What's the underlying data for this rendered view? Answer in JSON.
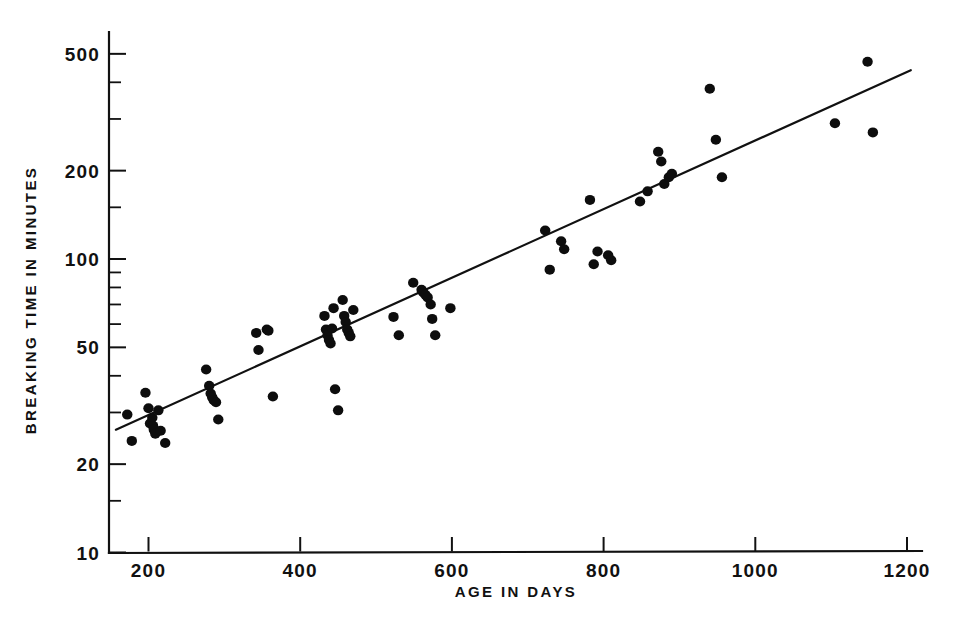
{
  "chart_data": {
    "type": "scatter",
    "title": "",
    "xlabel": "AGE  IN  DAYS",
    "ylabel": "BREAKING  TIME  IN  MINUTES",
    "xscale": "linear",
    "yscale": "log",
    "xlim": [
      150,
      1215
    ],
    "ylim": [
      10,
      560
    ],
    "grid": false,
    "legend": null,
    "xticks": [
      200,
      400,
      600,
      800,
      1000,
      1200
    ],
    "xtick_labels": [
      "200",
      "400",
      "600",
      "800",
      "1000",
      "1200"
    ],
    "yticks": [
      10,
      20,
      50,
      100,
      200,
      500
    ],
    "ytick_labels": [
      "10",
      "20",
      "50",
      "100",
      "200",
      "500"
    ],
    "yminor_ticks": [
      15,
      30,
      40,
      60,
      70,
      80,
      90,
      150,
      300,
      400
    ],
    "point_color": "#0d0d0d",
    "line_color": "#111111",
    "trend_line": {
      "x": [
        157,
        1205
      ],
      "y": [
        26.2,
        440
      ],
      "description": "fitted straight line on log-y axis"
    },
    "points": [
      {
        "x": 172,
        "y": 29.5
      },
      {
        "x": 178,
        "y": 24.0
      },
      {
        "x": 196,
        "y": 35.0
      },
      {
        "x": 200,
        "y": 31.0
      },
      {
        "x": 202,
        "y": 27.5
      },
      {
        "x": 205,
        "y": 28.8
      },
      {
        "x": 206,
        "y": 27.0
      },
      {
        "x": 207,
        "y": 26.2
      },
      {
        "x": 209,
        "y": 25.4
      },
      {
        "x": 213,
        "y": 30.5
      },
      {
        "x": 216,
        "y": 26.0
      },
      {
        "x": 222,
        "y": 23.6
      },
      {
        "x": 276,
        "y": 42.0
      },
      {
        "x": 280,
        "y": 37.0
      },
      {
        "x": 282,
        "y": 34.8
      },
      {
        "x": 284,
        "y": 33.8
      },
      {
        "x": 286,
        "y": 33.0
      },
      {
        "x": 289,
        "y": 32.5
      },
      {
        "x": 292,
        "y": 28.4
      },
      {
        "x": 342,
        "y": 56.0
      },
      {
        "x": 345,
        "y": 49.0
      },
      {
        "x": 356,
        "y": 57.5
      },
      {
        "x": 358,
        "y": 57.0
      },
      {
        "x": 364,
        "y": 34.0
      },
      {
        "x": 432,
        "y": 64.0
      },
      {
        "x": 434,
        "y": 57.5
      },
      {
        "x": 436,
        "y": 55.0
      },
      {
        "x": 438,
        "y": 53.0
      },
      {
        "x": 440,
        "y": 51.5
      },
      {
        "x": 442,
        "y": 58.0
      },
      {
        "x": 444,
        "y": 68.0
      },
      {
        "x": 446,
        "y": 36.0
      },
      {
        "x": 450,
        "y": 30.5
      },
      {
        "x": 456,
        "y": 72.5
      },
      {
        "x": 458,
        "y": 64.0
      },
      {
        "x": 460,
        "y": 61.0
      },
      {
        "x": 462,
        "y": 57.5
      },
      {
        "x": 464,
        "y": 56.0
      },
      {
        "x": 466,
        "y": 54.5
      },
      {
        "x": 470,
        "y": 67.0
      },
      {
        "x": 523,
        "y": 63.5
      },
      {
        "x": 530,
        "y": 55.0
      },
      {
        "x": 549,
        "y": 83.0
      },
      {
        "x": 560,
        "y": 78.5
      },
      {
        "x": 562,
        "y": 77.0
      },
      {
        "x": 565,
        "y": 75.5
      },
      {
        "x": 568,
        "y": 74.0
      },
      {
        "x": 572,
        "y": 70.0
      },
      {
        "x": 574,
        "y": 62.5
      },
      {
        "x": 578,
        "y": 55.0
      },
      {
        "x": 598,
        "y": 68.0
      },
      {
        "x": 723,
        "y": 125.0
      },
      {
        "x": 729,
        "y": 92.0
      },
      {
        "x": 744,
        "y": 115.0
      },
      {
        "x": 748,
        "y": 108.0
      },
      {
        "x": 782,
        "y": 159.0
      },
      {
        "x": 787,
        "y": 96.0
      },
      {
        "x": 792,
        "y": 106.0
      },
      {
        "x": 806,
        "y": 103.0
      },
      {
        "x": 810,
        "y": 99.0
      },
      {
        "x": 848,
        "y": 157.0
      },
      {
        "x": 858,
        "y": 170.0
      },
      {
        "x": 872,
        "y": 232.0
      },
      {
        "x": 876,
        "y": 215.0
      },
      {
        "x": 880,
        "y": 180.0
      },
      {
        "x": 886,
        "y": 190.0
      },
      {
        "x": 890,
        "y": 195.0
      },
      {
        "x": 940,
        "y": 380.0
      },
      {
        "x": 948,
        "y": 255.0
      },
      {
        "x": 956,
        "y": 190.0
      },
      {
        "x": 1105,
        "y": 290.0
      },
      {
        "x": 1148,
        "y": 470.0
      },
      {
        "x": 1155,
        "y": 270.0
      }
    ]
  },
  "axes": {
    "x_axis_name": "age-axis",
    "y_axis_name": "breaking-time-axis"
  }
}
